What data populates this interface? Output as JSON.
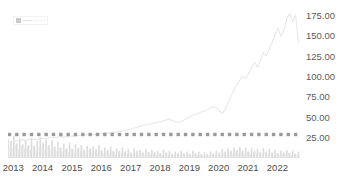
{
  "chart_data": {
    "type": "line",
    "title": "",
    "subtitle": "",
    "xlabel": "",
    "ylabel": "",
    "ylim": [
      0,
      187.5
    ],
    "ytick_labels": [
      "175.00",
      "150.00",
      "125.00",
      "100.00",
      "75.00",
      "50.00",
      "25.00"
    ],
    "ytick_values": [
      175,
      150,
      125,
      100,
      75,
      50,
      25
    ],
    "xtick_labels": [
      "2013",
      "2014",
      "2015",
      "2016",
      "2017",
      "2018",
      "2019",
      "2020",
      "2021",
      "2022"
    ],
    "xtick_values": [
      2013,
      2014,
      2015,
      2016,
      2017,
      2018,
      2019,
      2020,
      2021,
      2022
    ],
    "grid": false,
    "legend_position": "top-left",
    "legend_entries": [
      "series"
    ],
    "x_start": 2013.0,
    "x_end": 2022.95,
    "series": [
      {
        "name": "price-line",
        "type": "line",
        "color": "#e8e8e8",
        "x": [
          2013.0,
          2013.1,
          2013.2,
          2013.3,
          2013.4,
          2013.5,
          2013.6,
          2013.7,
          2013.8,
          2013.9,
          2014.0,
          2014.1,
          2014.2,
          2014.3,
          2014.4,
          2014.5,
          2014.6,
          2014.7,
          2014.8,
          2014.9,
          2015.0,
          2015.1,
          2015.2,
          2015.3,
          2015.4,
          2015.5,
          2015.6,
          2015.7,
          2015.8,
          2015.9,
          2016.0,
          2016.1,
          2016.2,
          2016.3,
          2016.4,
          2016.5,
          2016.6,
          2016.7,
          2016.8,
          2016.9,
          2017.0,
          2017.1,
          2017.2,
          2017.3,
          2017.4,
          2017.5,
          2017.6,
          2017.7,
          2017.8,
          2017.9,
          2018.0,
          2018.1,
          2018.2,
          2018.3,
          2018.4,
          2018.5,
          2018.6,
          2018.7,
          2018.8,
          2018.9,
          2019.0,
          2019.1,
          2019.2,
          2019.3,
          2019.4,
          2019.5,
          2019.6,
          2019.7,
          2019.8,
          2019.9,
          2020.0,
          2020.1,
          2020.2,
          2020.3,
          2020.4,
          2020.5,
          2020.6,
          2020.7,
          2020.8,
          2020.9,
          2021.0,
          2021.1,
          2021.2,
          2021.3,
          2021.4,
          2021.5,
          2021.6,
          2021.7,
          2021.8,
          2021.9,
          2022.0,
          2022.1,
          2022.2,
          2022.3,
          2022.4,
          2022.5,
          2022.6,
          2022.7,
          2022.8,
          2022.9
        ],
        "y": [
          20,
          20,
          21,
          21,
          22,
          22,
          22,
          23,
          23,
          23,
          23,
          24,
          24,
          24,
          25,
          25,
          25,
          26,
          26,
          26,
          26,
          27,
          27,
          27,
          28,
          28,
          28,
          29,
          29,
          29,
          29,
          30,
          30,
          31,
          31,
          31,
          32,
          32,
          33,
          33,
          34,
          35,
          36,
          37,
          38,
          39,
          40,
          41,
          42,
          42,
          43,
          44,
          45,
          46,
          47,
          48,
          46,
          45,
          44,
          45,
          47,
          49,
          51,
          53,
          54,
          55,
          57,
          58,
          60,
          62,
          63,
          62,
          58,
          55,
          60,
          68,
          76,
          84,
          90,
          96,
          101,
          98,
          104,
          112,
          118,
          112,
          120,
          130,
          126,
          134,
          142,
          152,
          160,
          150,
          158,
          172,
          178,
          168,
          176,
          142
        ]
      },
      {
        "name": "volume-bars",
        "type": "bar",
        "color": "#dcdcdc",
        "x": [
          2013.0,
          2013.1,
          2013.2,
          2013.3,
          2013.4,
          2013.5,
          2013.6,
          2013.7,
          2013.8,
          2013.9,
          2014.0,
          2014.1,
          2014.2,
          2014.3,
          2014.4,
          2014.5,
          2014.6,
          2014.7,
          2014.8,
          2014.9,
          2015.0,
          2015.1,
          2015.2,
          2015.3,
          2015.4,
          2015.5,
          2015.6,
          2015.7,
          2015.8,
          2015.9,
          2016.0,
          2016.1,
          2016.2,
          2016.3,
          2016.4,
          2016.5,
          2016.6,
          2016.7,
          2016.8,
          2016.9,
          2017.0,
          2017.1,
          2017.2,
          2017.3,
          2017.4,
          2017.5,
          2017.6,
          2017.7,
          2017.8,
          2017.9,
          2018.0,
          2018.1,
          2018.2,
          2018.3,
          2018.4,
          2018.5,
          2018.6,
          2018.7,
          2018.8,
          2018.9,
          2019.0,
          2019.1,
          2019.2,
          2019.3,
          2019.4,
          2019.5,
          2019.6,
          2019.7,
          2019.8,
          2019.9,
          2020.0,
          2020.1,
          2020.2,
          2020.3,
          2020.4,
          2020.5,
          2020.6,
          2020.7,
          2020.8,
          2020.9,
          2021.0,
          2021.1,
          2021.2,
          2021.3,
          2021.4,
          2021.5,
          2021.6,
          2021.7,
          2021.8,
          2021.9,
          2022.0,
          2022.1,
          2022.2,
          2022.3,
          2022.4,
          2022.5,
          2022.6,
          2022.7,
          2022.8,
          2022.9
        ],
        "y": [
          23,
          20,
          27,
          18,
          24,
          17,
          22,
          16,
          25,
          15,
          21,
          26,
          19,
          23,
          16,
          22,
          14,
          20,
          13,
          18,
          12,
          19,
          11,
          17,
          13,
          16,
          10,
          15,
          12,
          14,
          11,
          16,
          9,
          13,
          10,
          14,
          8,
          12,
          9,
          13,
          8,
          11,
          7,
          12,
          9,
          10,
          7,
          11,
          8,
          10,
          7,
          9,
          6,
          10,
          7,
          9,
          5,
          8,
          6,
          9,
          6,
          8,
          5,
          9,
          6,
          8,
          5,
          7,
          5,
          8,
          6,
          9,
          7,
          11,
          8,
          12,
          9,
          13,
          10,
          14,
          9,
          13,
          8,
          12,
          9,
          11,
          7,
          12,
          8,
          11,
          7,
          10,
          6,
          9,
          7,
          10,
          6,
          9,
          5,
          8
        ]
      },
      {
        "name": "marker-row",
        "type": "scatter",
        "color": "#9a9a9a",
        "marker": "square",
        "x": [
          2013.05,
          2013.3,
          2013.55,
          2013.8,
          2014.05,
          2014.3,
          2014.55,
          2014.8,
          2015.05,
          2015.3,
          2015.55,
          2015.8,
          2016.05,
          2016.3,
          2016.55,
          2016.8,
          2017.05,
          2017.3,
          2017.55,
          2017.8,
          2018.05,
          2018.3,
          2018.55,
          2018.8,
          2019.05,
          2019.3,
          2019.55,
          2019.8,
          2020.05,
          2020.3,
          2020.55,
          2020.8,
          2021.05,
          2021.3,
          2021.55,
          2021.8,
          2022.05,
          2022.3,
          2022.55,
          2022.8
        ],
        "y": [
          29,
          29,
          29,
          29,
          29,
          29,
          29,
          29,
          29,
          29,
          29,
          29,
          29,
          29,
          29,
          29,
          29,
          29,
          29,
          29,
          29,
          29,
          29,
          29,
          29,
          29,
          29,
          29,
          29,
          29,
          29,
          29,
          29,
          29,
          29,
          29,
          29,
          29,
          29,
          29
        ]
      }
    ]
  },
  "legend": {
    "label": "--- ---"
  },
  "colors": {
    "background": "#ffffff",
    "line": "#e8e8e8",
    "bar": "#dcdcdc",
    "marker": "#9a9a9a",
    "axis_text": "#5b5b5b",
    "axis_line": "#d9d9d9"
  }
}
